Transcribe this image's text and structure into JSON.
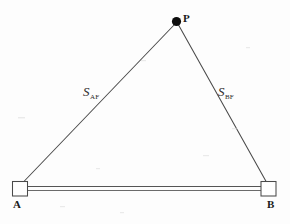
{
  "figure": {
    "type": "geometry-diagram",
    "background_color": "#fdfdfd",
    "ink_color": "#3a3a3a",
    "dot_color": "#0d0d0d"
  },
  "nodes": [
    {
      "id": "P",
      "label": "P",
      "marker": "filled-dot",
      "x": 176,
      "y": 21,
      "label_x": 183,
      "label_y": 13
    },
    {
      "id": "A",
      "label": "A",
      "marker": "open-square",
      "x": 21,
      "y": 188,
      "label_x": 13,
      "label_y": 199
    },
    {
      "id": "B",
      "label": "B",
      "marker": "open-square",
      "x": 268,
      "y": 188,
      "label_x": 267,
      "label_y": 199
    }
  ],
  "edges": [
    {
      "id": "edge-AP",
      "from": "A",
      "to": "P",
      "style": "single-line",
      "symbol": "S",
      "subscript": "AF",
      "label_x": 83,
      "label_y": 83
    },
    {
      "id": "edge-BP",
      "from": "B",
      "to": "P",
      "style": "single-line",
      "symbol": "S",
      "subscript": "BF",
      "label_x": 218,
      "label_y": 83
    },
    {
      "id": "edge-AB",
      "from": "A",
      "to": "B",
      "style": "double-line",
      "symbol": "",
      "subscript": "",
      "label_x": 0,
      "label_y": 0
    }
  ],
  "markers": {
    "square_size": 15,
    "dot_radius": 4.6
  }
}
